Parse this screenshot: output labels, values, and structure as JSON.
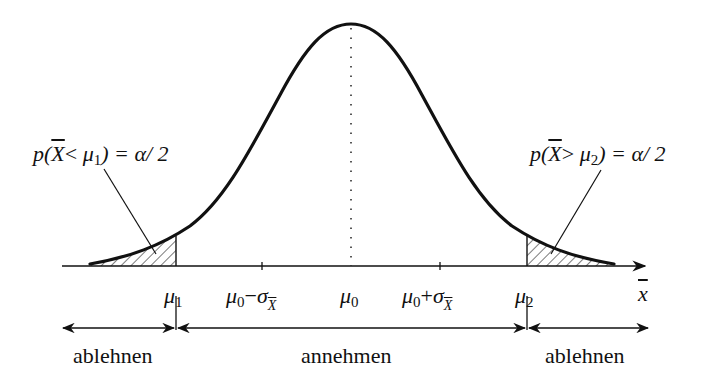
{
  "diagram": {
    "type": "normal-distribution-two-sided-test",
    "annotations": {
      "left_tail": {
        "p": "p(",
        "X": "X",
        "op": "< ",
        "mu": "μ",
        "sub": "1",
        "rhs": ") = α/ 2"
      },
      "right_tail": {
        "p": "p(",
        "X": "X",
        "op": "> ",
        "mu": "μ",
        "sub": "2",
        "rhs": ") = α/ 2"
      }
    },
    "axis": {
      "label": "x",
      "ticks": [
        {
          "mu": "μ",
          "sub": "1"
        },
        {
          "mu": "μ",
          "sub": "0",
          "op": "−",
          "sigma": "σ",
          "sigsub": "X"
        },
        {
          "mu": "μ",
          "sub": "0"
        },
        {
          "mu": "μ",
          "sub": "0",
          "op": "+",
          "sigma": "σ",
          "sigsub": "X"
        },
        {
          "mu": "μ",
          "sub": "2"
        }
      ]
    },
    "regions": [
      {
        "label": "ablehnen"
      },
      {
        "label": "annehmen"
      },
      {
        "label": "ablehnen"
      }
    ]
  }
}
